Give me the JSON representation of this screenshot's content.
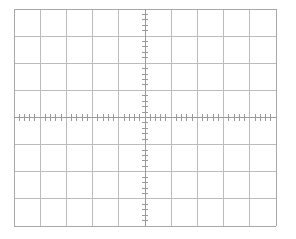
{
  "figure": {
    "name": "oscilloscope-graticule",
    "title": "",
    "background_color": "#ffffff",
    "width": 296,
    "height": 239
  },
  "chart_data": {
    "type": "grid",
    "title": "",
    "subtitle": "",
    "xlabel": "",
    "ylabel": "",
    "grid": true,
    "legend": null,
    "annotations": [],
    "series": [],
    "plot_area": {
      "left": 14,
      "top": 9,
      "right": 276,
      "bottom": 226,
      "width": 262,
      "height": 217
    },
    "divisions": {
      "horizontal_count": 10,
      "vertical_count": 8,
      "horizontal_step_px": 26.2,
      "vertical_step_px": 27.125
    },
    "x": [
      0,
      1,
      2,
      3,
      4,
      5,
      6,
      7,
      8,
      9,
      10
    ],
    "y": [
      0,
      1,
      2,
      3,
      4,
      5,
      6,
      7,
      8
    ],
    "xlim": [
      0,
      10
    ],
    "ylim": [
      0,
      8
    ],
    "center_axis": {
      "vertical_division": 5,
      "horizontal_division": 4,
      "vertical_x_px": 145,
      "horizontal_y_px": 118.25
    },
    "minor_ticks": {
      "per_division": 5,
      "subdivision_step_div": 0.2,
      "x_axis_tick_half_length_px": 3.2,
      "y_axis_tick_half_length_px": 3.2,
      "x_axis_tick_count": 49,
      "y_axis_tick_count": 39
    },
    "xtick_labels": [],
    "ytick_labels": [],
    "colors": {
      "background": "#ffffff",
      "grid_line": "#bcbcbc",
      "border_line": "#a8a8a8",
      "center_axis_line": "#9a9a9a",
      "minor_tick": "#9a9a9a"
    },
    "line_widths": {
      "grid_line": 1,
      "border_line": 1,
      "center_axis_line": 1,
      "minor_tick": 1
    }
  }
}
